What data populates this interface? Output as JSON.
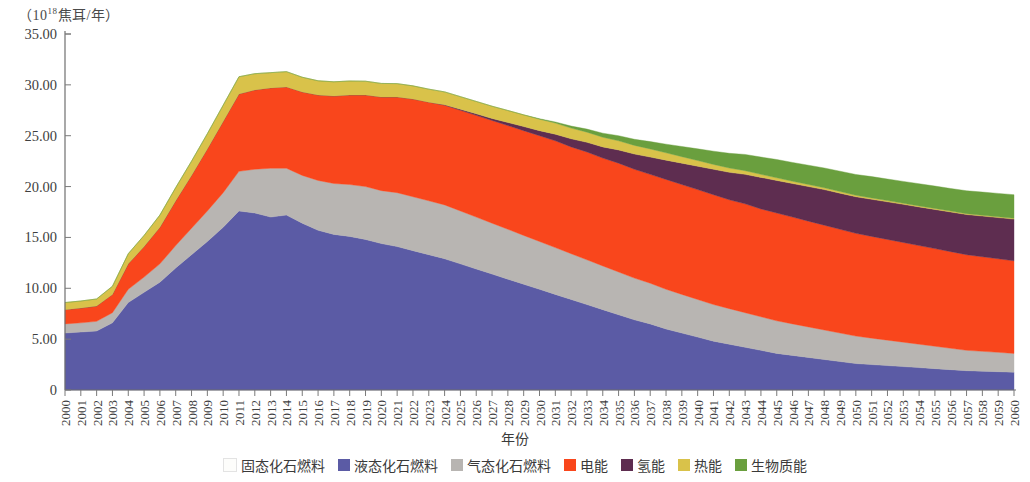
{
  "axis": {
    "y_unit_prefix": "（10",
    "y_unit_exp": "18",
    "y_unit_suffix": "焦耳/年）",
    "x_title": "年份",
    "y_ticks": [
      "0",
      "5.00",
      "10.00",
      "15.00",
      "20.00",
      "25.00",
      "30.00",
      "35.00"
    ]
  },
  "legend": {
    "items": [
      {
        "label": "固态化石燃料",
        "color": "#fdfdfb"
      },
      {
        "label": "液态化石燃料",
        "color": "#5b5ba5"
      },
      {
        "label": "气态化石燃料",
        "color": "#b8b5b2"
      },
      {
        "label": "电能",
        "color": "#f9461c"
      },
      {
        "label": "氢能",
        "color": "#5e2d50"
      },
      {
        "label": "热能",
        "color": "#d9c24a"
      },
      {
        "label": "生物质能",
        "color": "#6a9f3e"
      }
    ]
  },
  "chart_data": {
    "type": "area",
    "title": "",
    "xlabel": "年份",
    "ylabel": "（10^18焦耳/年）",
    "ylim": [
      0,
      35
    ],
    "grid": false,
    "legend_position": "bottom",
    "stacked": true,
    "categories": [
      2000,
      2001,
      2002,
      2003,
      2004,
      2005,
      2006,
      2007,
      2008,
      2009,
      2010,
      2011,
      2012,
      2013,
      2014,
      2015,
      2016,
      2017,
      2018,
      2019,
      2020,
      2021,
      2022,
      2023,
      2024,
      2025,
      2026,
      2027,
      2028,
      2029,
      2030,
      2031,
      2032,
      2033,
      2034,
      2035,
      2036,
      2037,
      2038,
      2039,
      2040,
      2041,
      2042,
      2043,
      2044,
      2045,
      2046,
      2047,
      2048,
      2049,
      2050,
      2051,
      2052,
      2053,
      2054,
      2055,
      2056,
      2057,
      2058,
      2059,
      2060
    ],
    "series": [
      {
        "name": "固态化石燃料",
        "color": "#fdfdfb",
        "values": [
          0,
          0,
          0,
          0,
          0,
          0,
          0,
          0,
          0,
          0,
          0,
          0,
          0,
          0,
          0,
          0,
          0,
          0,
          0,
          0,
          0,
          0,
          0,
          0,
          0,
          0,
          0,
          0,
          0,
          0,
          0,
          0,
          0,
          0,
          0,
          0,
          0,
          0,
          0,
          0,
          0,
          0,
          0,
          0,
          0,
          0,
          0,
          0,
          0,
          0,
          0,
          0,
          0,
          0,
          0,
          0,
          0,
          0,
          0,
          0,
          0
        ]
      },
      {
        "name": "液态化石燃料",
        "color": "#5b5ba5",
        "values": [
          5.6,
          5.7,
          5.8,
          6.6,
          8.6,
          9.6,
          10.6,
          12.0,
          13.3,
          14.6,
          16.0,
          17.6,
          17.4,
          17.0,
          17.2,
          16.4,
          15.7,
          15.3,
          15.1,
          14.8,
          14.4,
          14.1,
          13.7,
          13.3,
          12.9,
          12.4,
          11.9,
          11.4,
          10.9,
          10.4,
          9.9,
          9.4,
          8.9,
          8.4,
          7.9,
          7.4,
          6.9,
          6.5,
          6.0,
          5.6,
          5.2,
          4.8,
          4.5,
          4.2,
          3.9,
          3.6,
          3.4,
          3.2,
          3.0,
          2.8,
          2.6,
          2.5,
          2.4,
          2.3,
          2.2,
          2.1,
          2.0,
          1.9,
          1.85,
          1.8,
          1.75
        ]
      },
      {
        "name": "气态化石燃料",
        "color": "#b8b5b2",
        "values": [
          0.9,
          0.9,
          0.95,
          1.0,
          1.3,
          1.5,
          1.8,
          2.2,
          2.6,
          3.0,
          3.4,
          3.9,
          4.3,
          4.8,
          4.6,
          4.7,
          4.9,
          5.0,
          5.1,
          5.2,
          5.2,
          5.3,
          5.3,
          5.3,
          5.3,
          5.2,
          5.1,
          5.0,
          4.9,
          4.8,
          4.7,
          4.6,
          4.5,
          4.4,
          4.3,
          4.2,
          4.1,
          4.0,
          3.9,
          3.8,
          3.7,
          3.6,
          3.5,
          3.4,
          3.3,
          3.2,
          3.1,
          3.0,
          2.9,
          2.8,
          2.7,
          2.6,
          2.5,
          2.4,
          2.3,
          2.2,
          2.1,
          2.0,
          1.95,
          1.9,
          1.85
        ]
      },
      {
        "name": "电能",
        "color": "#f9461c",
        "values": [
          1.4,
          1.45,
          1.5,
          1.8,
          2.5,
          3.0,
          3.6,
          4.4,
          5.2,
          6.1,
          7.0,
          7.6,
          7.8,
          7.9,
          8.0,
          8.2,
          8.4,
          8.6,
          8.8,
          9.0,
          9.2,
          9.4,
          9.6,
          9.7,
          9.8,
          9.9,
          10.0,
          10.1,
          10.2,
          10.3,
          10.4,
          10.5,
          10.5,
          10.6,
          10.6,
          10.7,
          10.7,
          10.7,
          10.8,
          10.8,
          10.8,
          10.8,
          10.7,
          10.7,
          10.6,
          10.6,
          10.5,
          10.4,
          10.3,
          10.2,
          10.1,
          10.0,
          9.9,
          9.8,
          9.7,
          9.6,
          9.5,
          9.4,
          9.3,
          9.2,
          9.1
        ]
      },
      {
        "name": "氢能",
        "color": "#5e2d50",
        "values": [
          0,
          0,
          0,
          0,
          0,
          0,
          0,
          0,
          0,
          0,
          0,
          0,
          0,
          0,
          0,
          0,
          0,
          0,
          0,
          0,
          0,
          0,
          0,
          0,
          0.05,
          0.1,
          0.15,
          0.2,
          0.3,
          0.4,
          0.5,
          0.65,
          0.8,
          0.95,
          1.1,
          1.3,
          1.5,
          1.7,
          1.9,
          2.1,
          2.3,
          2.5,
          2.7,
          2.9,
          3.1,
          3.2,
          3.3,
          3.4,
          3.5,
          3.55,
          3.6,
          3.65,
          3.7,
          3.75,
          3.8,
          3.85,
          3.9,
          3.95,
          4.0,
          4.05,
          4.1
        ]
      },
      {
        "name": "热能",
        "color": "#d9c24a",
        "values": [
          0.7,
          0.7,
          0.7,
          0.8,
          1.0,
          1.1,
          1.2,
          1.3,
          1.4,
          1.5,
          1.6,
          1.7,
          1.6,
          1.5,
          1.5,
          1.45,
          1.4,
          1.4,
          1.38,
          1.36,
          1.34,
          1.32,
          1.3,
          1.28,
          1.26,
          1.24,
          1.22,
          1.2,
          1.18,
          1.15,
          1.12,
          1.1,
          1.05,
          1.0,
          0.95,
          0.9,
          0.85,
          0.8,
          0.72,
          0.64,
          0.56,
          0.48,
          0.42,
          0.36,
          0.3,
          0.26,
          0.22,
          0.2,
          0.18,
          0.16,
          0.14,
          0.13,
          0.12,
          0.11,
          0.1,
          0.1,
          0.09,
          0.09,
          0.08,
          0.08,
          0.08
        ]
      },
      {
        "name": "生物质能",
        "color": "#6a9f3e",
        "values": [
          0,
          0,
          0,
          0,
          0,
          0,
          0,
          0,
          0,
          0,
          0,
          0,
          0,
          0,
          0,
          0,
          0,
          0,
          0,
          0,
          0,
          0,
          0,
          0,
          0,
          0,
          0,
          0,
          0,
          0,
          0.05,
          0.1,
          0.2,
          0.3,
          0.4,
          0.5,
          0.6,
          0.72,
          0.85,
          1.0,
          1.15,
          1.3,
          1.45,
          1.6,
          1.7,
          1.8,
          1.85,
          1.9,
          1.95,
          2.0,
          2.05,
          2.1,
          2.12,
          2.15,
          2.18,
          2.2,
          2.22,
          2.25,
          2.28,
          2.3,
          2.32
        ]
      }
    ]
  }
}
